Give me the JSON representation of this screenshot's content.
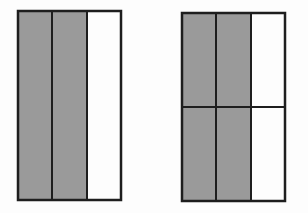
{
  "diagram": {
    "colors": {
      "shaded": "#9a9a9a",
      "unshaded": "#fdfdfd",
      "stroke": "#1e1e1e",
      "background": "#fdfdfd"
    },
    "models": [
      {
        "name": "left-model",
        "columns": 3,
        "rows": 1,
        "shaded_cells": 2,
        "total_cells": 3,
        "fraction": "2/3"
      },
      {
        "name": "right-model",
        "columns": 3,
        "rows": 2,
        "shaded_cells": 4,
        "total_cells": 6,
        "fraction": "4/6"
      }
    ]
  }
}
